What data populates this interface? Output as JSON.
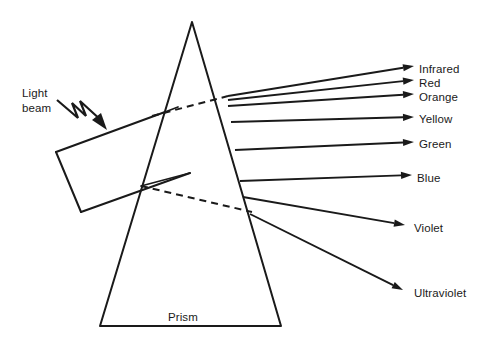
{
  "figure": {
    "kind": "line-diagram",
    "background_color": "#ffffff",
    "ink_color": "#1a1a1a"
  },
  "source_beam": {
    "label_line1": "Light",
    "label_line2": "beam",
    "pointer_icon": "zigzag-arrow-icon",
    "shape_icon": "incident-beam-parallelogram-icon"
  },
  "prism": {
    "label": "Prism",
    "shape_icon": "triangle-prism-icon",
    "apex": {
      "x": 192,
      "y": 22
    },
    "base_left": {
      "x": 100,
      "y": 326
    },
    "base_right": {
      "x": 281,
      "y": 326
    }
  },
  "internal_rays": {
    "upper_dashed_icon": "dashed-refraction-line-icon",
    "lower_dashed_icon": "dashed-refraction-line-icon"
  },
  "spectrum": {
    "title": "Dispersed spectrum rays",
    "rays": [
      {
        "name": "Infrared",
        "label": "Infrared",
        "exit": {
          "x": 228,
          "y": 96
        },
        "tip": {
          "x": 414,
          "y": 66
        },
        "text_x": 419,
        "text_y": 62
      },
      {
        "name": "Red",
        "label": "Red",
        "exit": {
          "x": 228,
          "y": 100
        },
        "tip": {
          "x": 414,
          "y": 80
        },
        "text_x": 419,
        "text_y": 76
      },
      {
        "name": "Orange",
        "label": "Orange",
        "exit": {
          "x": 228,
          "y": 106
        },
        "tip": {
          "x": 414,
          "y": 94
        },
        "text_x": 419,
        "text_y": 90
      },
      {
        "name": "Yellow",
        "label": "Yellow",
        "exit": {
          "x": 231,
          "y": 122
        },
        "tip": {
          "x": 414,
          "y": 117
        },
        "text_x": 419,
        "text_y": 112
      },
      {
        "name": "Green",
        "label": "Green",
        "exit": {
          "x": 235,
          "y": 150
        },
        "tip": {
          "x": 414,
          "y": 142
        },
        "text_x": 419,
        "text_y": 137
      },
      {
        "name": "Blue",
        "label": "Blue",
        "exit": {
          "x": 240,
          "y": 181
        },
        "tip": {
          "x": 412,
          "y": 175
        },
        "text_x": 417,
        "text_y": 171
      },
      {
        "name": "Violet",
        "label": "Violet",
        "exit": {
          "x": 243,
          "y": 197
        },
        "tip": {
          "x": 405,
          "y": 225
        },
        "text_x": 414,
        "text_y": 221
      },
      {
        "name": "Ultraviolet",
        "label": "Ultraviolet",
        "exit": {
          "x": 250,
          "y": 214
        },
        "tip": {
          "x": 403,
          "y": 290
        },
        "text_x": 414,
        "text_y": 286
      }
    ]
  }
}
